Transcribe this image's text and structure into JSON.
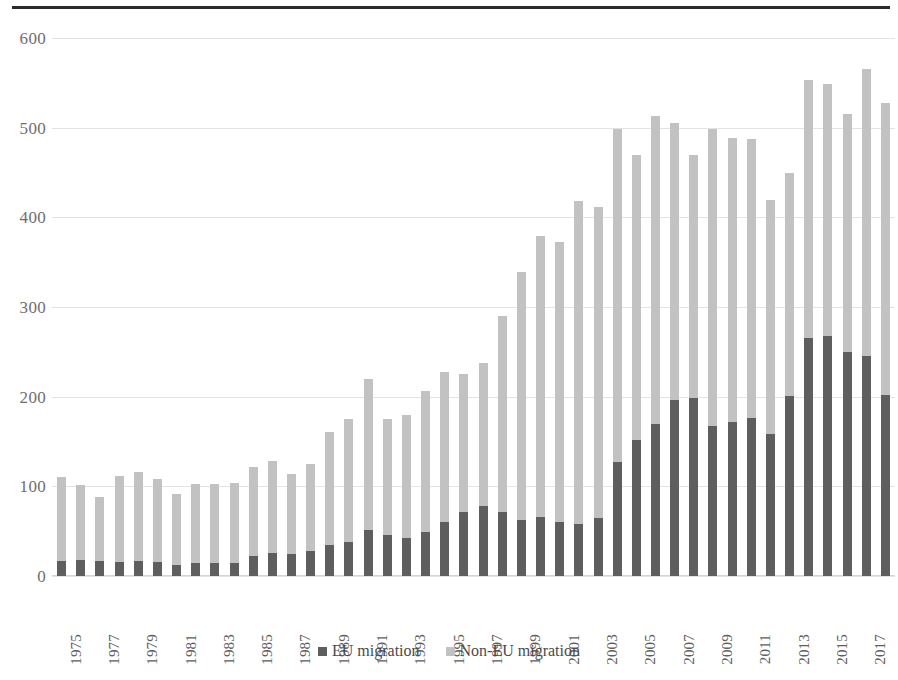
{
  "chart_data": {
    "type": "bar",
    "stacked": true,
    "title": "",
    "subtitle": "",
    "xlabel": "",
    "ylabel": "",
    "ylim": [
      0,
      600
    ],
    "yticks": [
      0,
      100,
      200,
      300,
      400,
      500,
      600
    ],
    "ytick_labels": [
      "0",
      "100",
      "200",
      "300",
      "400",
      "500",
      "600"
    ],
    "grid": true,
    "legend_position": "bottom",
    "legend": [
      "EU migration",
      "Non-EU migration"
    ],
    "categories": [
      "1975",
      "1976",
      "1977",
      "1978",
      "1979",
      "1980",
      "1981",
      "1982",
      "1983",
      "1984",
      "1985",
      "1986",
      "1987",
      "1988",
      "1989",
      "1990",
      "1991",
      "1992",
      "1993",
      "1994",
      "1995",
      "1996",
      "1997",
      "1998",
      "1999",
      "2000",
      "2001",
      "2002",
      "2003",
      "2004",
      "2005",
      "2006",
      "2007",
      "2008",
      "2009",
      "2010",
      "2011",
      "2012",
      "2013",
      "2014",
      "2015",
      "2016",
      "2017",
      "2018"
    ],
    "xtick_labels": [
      "1975",
      "1977",
      "1979",
      "1981",
      "1983",
      "1985",
      "1987",
      "1989",
      "1991",
      "1993",
      "1995",
      "1997",
      "1999",
      "2001",
      "2003",
      "2005",
      "2007",
      "2009",
      "2011",
      "2013",
      "2015",
      "2017"
    ],
    "series": [
      {
        "name": "EU migration",
        "color": "#5e5e5e",
        "values": [
          17,
          18,
          17,
          16,
          17,
          16,
          12,
          14,
          15,
          15,
          22,
          26,
          25,
          28,
          35,
          38,
          51,
          46,
          42,
          49,
          60,
          71,
          78,
          71,
          62,
          66,
          60,
          58,
          65,
          127,
          152,
          170,
          196,
          198,
          167,
          172,
          176,
          158,
          201,
          265,
          268,
          250,
          245,
          202
        ]
      },
      {
        "name": "Non-EU migration",
        "color": "#c2c2c2",
        "values": [
          93,
          84,
          71,
          96,
          99,
          92,
          80,
          89,
          88,
          89,
          100,
          102,
          89,
          97,
          126,
          137,
          169,
          129,
          138,
          157,
          168,
          154,
          160,
          219,
          277,
          313,
          312,
          360,
          347,
          372,
          318,
          343,
          309,
          272,
          331,
          316,
          311,
          261,
          248,
          288,
          281,
          265,
          321,
          326
        ]
      }
    ],
    "totals": [
      110,
      102,
      88,
      112,
      116,
      108,
      92,
      103,
      103,
      104,
      122,
      128,
      114,
      125,
      161,
      175,
      220,
      175,
      180,
      206,
      228,
      225,
      238,
      290,
      339,
      379,
      372,
      418,
      412,
      499,
      470,
      513,
      505,
      470,
      498,
      488,
      487,
      419,
      449,
      553,
      549,
      515,
      566,
      528
    ],
    "units": "thousands"
  }
}
